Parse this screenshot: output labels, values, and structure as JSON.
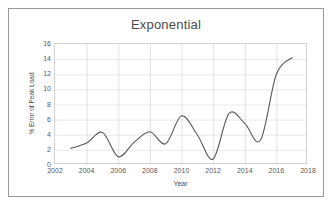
{
  "figure": {
    "caption_partial": ""
  },
  "axes": {
    "y_title": "% Error of Peak Load",
    "x_title": "Year"
  },
  "chart_data": {
    "type": "line",
    "title": "Exponential",
    "xlabel": "Year",
    "ylabel": "% Error of Peak Load",
    "xlim": [
      2002,
      2018
    ],
    "ylim": [
      0,
      16
    ],
    "xticks": [
      2002,
      2004,
      2006,
      2008,
      2010,
      2012,
      2014,
      2016,
      2018
    ],
    "yticks": [
      0,
      2,
      4,
      6,
      8,
      10,
      12,
      14,
      16
    ],
    "xtick_labels": [
      "2002",
      "2004",
      "2006",
      "2008",
      "2010",
      "2012",
      "2014",
      "2016",
      "2018"
    ],
    "ytick_labels": [
      "0",
      "2",
      "4",
      "6",
      "8",
      "10",
      "12",
      "14",
      "16"
    ],
    "grid": true,
    "grid_axis": "both",
    "legend": false,
    "legend_position": "none",
    "line_color": "#595959",
    "line_width": 1.1,
    "markers": false,
    "smoothed": true,
    "x": [
      2003,
      2004,
      2005,
      2006,
      2007,
      2008,
      2009,
      2010,
      2011,
      2012,
      2013,
      2014,
      2015,
      2016,
      2017
    ],
    "values": [
      2.2,
      2.9,
      4.3,
      1.1,
      3.0,
      4.4,
      2.8,
      6.5,
      4.0,
      0.8,
      6.8,
      5.5,
      3.3,
      12.0,
      14.2
    ],
    "series": [
      {
        "name": "Exponential",
        "values": [
          2.2,
          2.9,
          4.3,
          1.1,
          3.0,
          4.4,
          2.8,
          6.5,
          4.0,
          0.8,
          6.8,
          5.5,
          3.3,
          12.0,
          14.2
        ]
      }
    ]
  }
}
